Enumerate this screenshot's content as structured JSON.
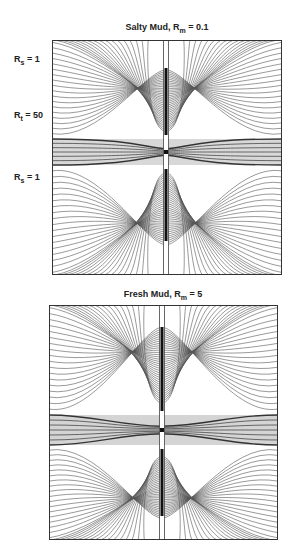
{
  "panels": [
    {
      "id": "salty",
      "title_prefix": "Salty Mud, R",
      "title_sub": "m",
      "title_suffix": " = 0.1",
      "title_x": 167,
      "title_y": 22,
      "box": {
        "x": 52,
        "y": 40,
        "w": 230,
        "h": 235
      },
      "borehole_x": 166,
      "layer": {
        "top": 99,
        "bottom": 125
      },
      "layer_fill": "#d8d8d8",
      "mode": "salty",
      "labels": [
        {
          "prefix": "R",
          "sub": "s",
          "suffix": " = 1",
          "x": 14,
          "y": 54
        },
        {
          "prefix": "R",
          "sub": "t",
          "suffix": " = 50",
          "x": 14,
          "y": 110
        },
        {
          "prefix": "R",
          "sub": "s",
          "suffix": " = 1",
          "x": 14,
          "y": 172
        }
      ]
    },
    {
      "id": "fresh",
      "title_prefix": "Fresh Mud, R",
      "title_sub": "m",
      "title_suffix": " = 5",
      "title_x": 163,
      "title_y": 289,
      "box": {
        "x": 49,
        "y": 305,
        "w": 229,
        "h": 235
      },
      "borehole_x": 162,
      "layer": {
        "top": 110,
        "bottom": 140
      },
      "layer_fill": "#d4d4d4",
      "mode": "fresh",
      "labels": []
    }
  ],
  "colors": {
    "line": "#555555",
    "frame": "#333333",
    "borehole": "#111111"
  }
}
